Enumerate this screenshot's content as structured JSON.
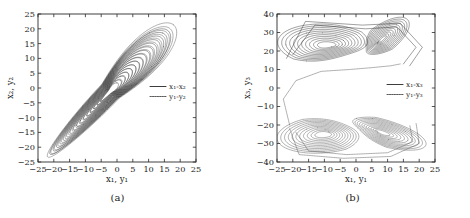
{
  "figure": {
    "panels": [
      {
        "id": "a",
        "caption": "(a)",
        "xlabel": "x₁, y₁",
        "ylabel": "x₂, y₂",
        "legend": [
          {
            "label": "x₁-x₂",
            "style": "solid"
          },
          {
            "label": "y₁-y₂",
            "style": "dotted"
          }
        ],
        "xticks": [
          "−25",
          "−20",
          "−15",
          "−10",
          "−5",
          "0",
          "5",
          "10",
          "15",
          "20",
          "25"
        ],
        "yticks": [
          "25",
          "20",
          "15",
          "10",
          "5",
          "0",
          "−5",
          "−10",
          "−15",
          "−20",
          "−25"
        ]
      },
      {
        "id": "b",
        "caption": "(b)",
        "xlabel": "x₁, y₁",
        "ylabel": "x₃, y₃",
        "legend": [
          {
            "label": "x₁-x₃",
            "style": "solid"
          },
          {
            "label": "y₁-y₃",
            "style": "dotted"
          }
        ],
        "xticks": [
          "−25",
          "−20",
          "−15",
          "−10",
          "−5",
          "0",
          "5",
          "10",
          "15",
          "20",
          "25"
        ],
        "yticks": [
          "40",
          "30",
          "20",
          "10",
          "0",
          "−10",
          "−20",
          "−30",
          "−40"
        ]
      }
    ]
  },
  "chart_data": [
    {
      "type": "line",
      "title": "(a)",
      "xlabel": "x₁, y₁",
      "ylabel": "x₂, y₂",
      "xlim": [
        -25,
        25
      ],
      "ylim": [
        -25,
        25
      ],
      "xticks": [
        -25,
        -20,
        -15,
        -10,
        -5,
        0,
        5,
        10,
        15,
        20,
        25
      ],
      "yticks": [
        -25,
        -20,
        -15,
        -10,
        -5,
        0,
        5,
        10,
        15,
        20,
        25
      ],
      "grid": false,
      "legend_position": "right-center",
      "series": [
        {
          "name": "x₁-x₂",
          "style": "solid",
          "description": "Chaotic attractor projection forming an elongated band inclined about 50 degrees along the main diagonal, spanning roughly x in [-21, 19] and x2 in [-22, 22]; composed of many nested loops winding around two foci near (-11, -9) and (6, 6).",
          "foci": [
            [
              -11,
              -9
            ],
            [
              6,
              6
            ]
          ],
          "extent_major_axis": [
            [
              -20,
              -21.5
            ],
            [
              18.5,
              21.5
            ]
          ]
        },
        {
          "name": "y₁-y₂",
          "style": "dotted",
          "description": "Response-system trajectory nearly overlapping the drive attractor, slightly offset outward, indicating synchronization.",
          "foci": [
            [
              -10.5,
              -8.5
            ],
            [
              6.5,
              6.5
            ]
          ],
          "extent_major_axis": [
            [
              -20.5,
              -22
            ],
            [
              19,
              22
            ]
          ]
        }
      ]
    },
    {
      "type": "line",
      "title": "(b)",
      "xlabel": "x₁, y₁",
      "ylabel": "x₃, y₃",
      "xlim": [
        -25,
        25
      ],
      "ylim": [
        -40,
        40
      ],
      "xticks": [
        -25,
        -20,
        -15,
        -10,
        -5,
        0,
        5,
        10,
        15,
        20,
        25
      ],
      "yticks": [
        -40,
        -30,
        -20,
        -10,
        0,
        10,
        20,
        30,
        40
      ],
      "grid": false,
      "legend_position": "right-center",
      "series": [
        {
          "name": "x₁-x₃",
          "style": "solid",
          "description": "Upper butterfly-shaped double-scroll attractor centred near x3 = 24, spanning x in [-22, 21] and x3 in [10, 38]; two wings with foci near (-9, 23) and (8, 26) joined at a saddle near (0, 14).",
          "foci": [
            [
              -9,
              23
            ],
            [
              8,
              26
            ]
          ],
          "bbox": [
            [
              -22,
              10
            ],
            [
              21,
              38
            ]
          ]
        },
        {
          "name": "y₁-y₃",
          "style": "dotted",
          "description": "Lower butterfly-shaped attractor centred near y3 = -26, spanning x in [-21, 20] and y3 in [-39, -14], plus a dotted transient arc rising from (-21, -20) through (-5, 8) to the upper region.",
          "foci": [
            [
              -10,
              -25
            ],
            [
              8,
              -24
            ]
          ],
          "bbox": [
            [
              -21,
              -39
            ],
            [
              20,
              -14
            ]
          ]
        }
      ]
    }
  ]
}
